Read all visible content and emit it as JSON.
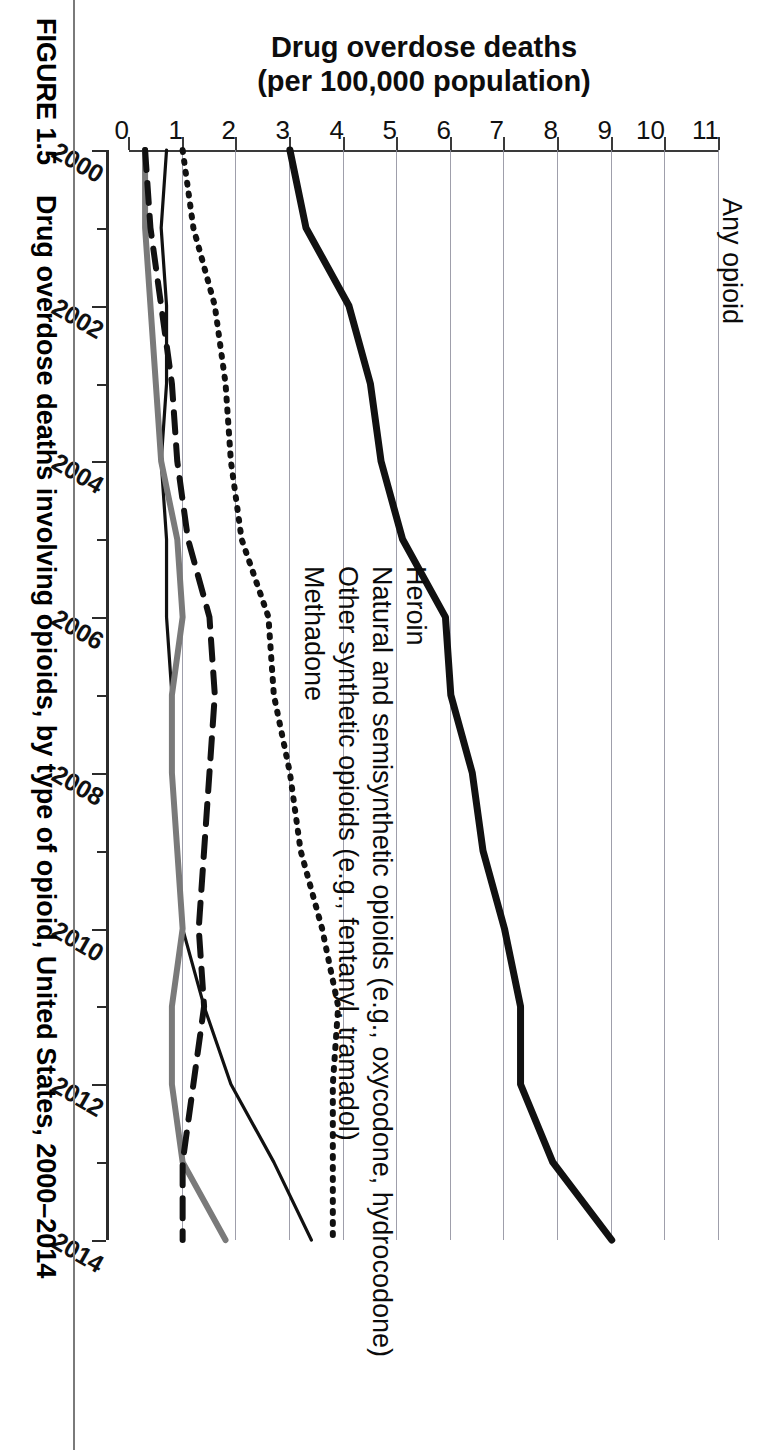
{
  "figure": {
    "caption_number": "FIGURE 1.5",
    "caption_text": "Drug overdose deaths involving opioids, by type of opioid, United States, 2000–2014"
  },
  "axis": {
    "y_title_line1": "Drug overdose deaths",
    "y_title_line2": "(per 100,000 population)",
    "y_ticks": [
      "0",
      "1",
      "2",
      "3",
      "4",
      "5",
      "6",
      "7",
      "8",
      "9",
      "10",
      "11"
    ],
    "x_ticks_major": [
      "2000",
      "2002",
      "2004",
      "2006",
      "2008",
      "2010",
      "2012",
      "2014"
    ]
  },
  "series_labels": {
    "any_opioid": "Any opioid",
    "heroin": "Heroin",
    "natural_semisynthetic": "Natural and semisynthetic opioids (e.g., oxycodone, hydrocodone)",
    "other_synthetic": "Other synthetic opioids (e.g., fentanyl, tramadol)",
    "methadone": "Methadone"
  },
  "colors": {
    "any_opioid": "#111111",
    "natural_semisynthetic": "#111111",
    "heroin": "#111111",
    "other_synthetic": "#7a7a7a",
    "methadone": "#111111",
    "grid": "#8e8e9c",
    "axis": "#333333"
  },
  "chart_data": {
    "type": "line",
    "title": "Drug overdose deaths involving opioids, by type of opioid, United States, 2000–2014",
    "xlabel": "",
    "ylabel": "Drug overdose deaths (per 100,000 population)",
    "xlim": [
      2000,
      2014
    ],
    "ylim": [
      0,
      11
    ],
    "grid": true,
    "legend": "in-plot line annotations",
    "x": [
      2000,
      2001,
      2002,
      2003,
      2004,
      2005,
      2006,
      2007,
      2008,
      2009,
      2010,
      2011,
      2012,
      2013,
      2014
    ],
    "series": [
      {
        "name": "Any opioid",
        "style": "solid-thick",
        "color": "#111111",
        "values": [
          3.0,
          3.3,
          4.1,
          4.5,
          4.7,
          5.1,
          5.9,
          6.0,
          6.4,
          6.6,
          7.0,
          7.3,
          7.3,
          7.9,
          9.0
        ]
      },
      {
        "name": "Natural and semisynthetic opioids (e.g., oxycodone, hydrocodone)",
        "style": "dotted",
        "color": "#111111",
        "values": [
          1.0,
          1.2,
          1.6,
          1.8,
          1.9,
          2.1,
          2.6,
          2.7,
          3.0,
          3.2,
          3.6,
          3.9,
          3.8,
          3.8,
          3.8
        ]
      },
      {
        "name": "Heroin",
        "style": "solid-thin",
        "color": "#111111",
        "values": [
          0.7,
          0.6,
          0.7,
          0.7,
          0.6,
          0.7,
          0.7,
          0.8,
          0.8,
          0.9,
          1.0,
          1.4,
          1.9,
          2.7,
          3.4
        ]
      },
      {
        "name": "Other synthetic opioids (e.g., fentanyl, tramadol)",
        "style": "solid-gray",
        "color": "#7a7a7a",
        "values": [
          0.3,
          0.3,
          0.4,
          0.5,
          0.6,
          0.9,
          1.0,
          0.8,
          0.8,
          0.9,
          1.0,
          0.8,
          0.8,
          1.0,
          1.8
        ]
      },
      {
        "name": "Methadone",
        "style": "dashed",
        "color": "#111111",
        "values": [
          0.3,
          0.4,
          0.6,
          0.8,
          0.9,
          1.1,
          1.5,
          1.6,
          1.5,
          1.4,
          1.3,
          1.4,
          1.2,
          1.0,
          1.0
        ]
      }
    ]
  }
}
